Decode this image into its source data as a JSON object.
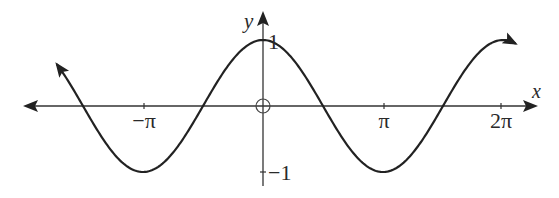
{
  "chart_data": {
    "type": "line",
    "title": "",
    "function": "y = cos(x)",
    "xlabel": "x",
    "ylabel": "y",
    "origin_label": "O",
    "x_ticks": [
      {
        "value": -3.14159,
        "label": "−π"
      },
      {
        "value": 3.14159,
        "label": "π"
      },
      {
        "value": 6.28319,
        "label": "2π"
      }
    ],
    "y_ticks": [
      {
        "value": 1,
        "label": "1"
      },
      {
        "value": -1,
        "label": "−1"
      }
    ],
    "xlim": [
      -6.3,
      7.0
    ],
    "ylim": [
      -1.2,
      1.3
    ],
    "grid": false,
    "legend": false,
    "series": [
      {
        "name": "cos x",
        "x_range": [
          -5.39,
          6.6
        ],
        "arrows": [
          "start",
          "end"
        ],
        "key_points": [
          {
            "x": -4.712,
            "y": 0
          },
          {
            "x": -3.14159,
            "y": -1
          },
          {
            "x": -1.5708,
            "y": 0
          },
          {
            "x": 0,
            "y": 1
          },
          {
            "x": 1.5708,
            "y": 0
          },
          {
            "x": 3.14159,
            "y": -1
          },
          {
            "x": 4.712,
            "y": 0
          }
        ]
      }
    ],
    "colors": {
      "curve": "#222222",
      "axis": "#333333"
    }
  },
  "labels": {
    "x_axis": "x",
    "y_axis": "y",
    "tick_neg_pi": "−π",
    "tick_pi": "π",
    "tick_2pi": "2π",
    "tick_y1": "1",
    "tick_ym1": "−1"
  }
}
